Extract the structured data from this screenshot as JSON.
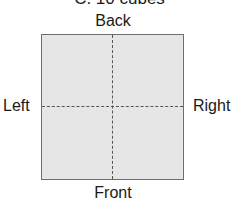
{
  "diagram": {
    "title": "C. 10 cubes",
    "labels": {
      "top": "Back",
      "bottom": "Front",
      "left": "Left",
      "right": "Right"
    },
    "colors": {
      "square_fill": "#e6e6e6",
      "square_border": "#6e6e6e",
      "dash": "#555555"
    }
  }
}
